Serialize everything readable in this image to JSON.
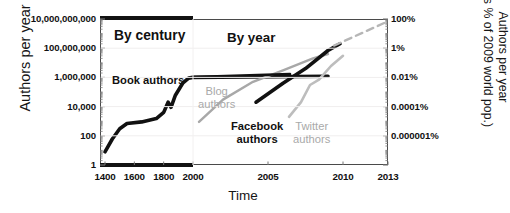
{
  "chart_data": {
    "type": "line",
    "title": "",
    "xlabel": "Time",
    "ylabel": "Authors per year",
    "ylabel_right": "Authors per year (as % of 2009 world pop.)",
    "ylabel_right_line1": "Authors per year",
    "ylabel_right_line2": "(as % of 2009 world pop.)",
    "yticks": [
      "10,000,000,000",
      "100,000,000",
      "1,000,000",
      "10,000",
      "100",
      "1"
    ],
    "yticks_values": [
      10000000000,
      100000000,
      1000000,
      10000,
      100,
      1
    ],
    "yticks_right": [
      "100%",
      "1%",
      "0.01%",
      "0.0001%",
      "0.000001%"
    ],
    "yticks_right_values": [
      100,
      1,
      0.01,
      0.0001,
      1e-06
    ],
    "ylim": [
      1,
      10000000000
    ],
    "yscale": "log",
    "xticks_century": [
      "1400",
      "1600",
      "1800",
      "2000"
    ],
    "xticks_year": [
      "2005",
      "2010",
      "2013"
    ],
    "grid": false,
    "sections": [
      {
        "label": "By century",
        "range": "1400-2000"
      },
      {
        "label": "By year",
        "range": "2000-2013"
      }
    ],
    "series": [
      {
        "name": "Book authors",
        "color": "#111111",
        "style": "solid",
        "points": [
          {
            "x": 1400,
            "y": 8
          },
          {
            "x": 1450,
            "y": 60
          },
          {
            "x": 1500,
            "y": 300
          },
          {
            "x": 1550,
            "y": 700
          },
          {
            "x": 1650,
            "y": 900
          },
          {
            "x": 1750,
            "y": 1500
          },
          {
            "x": 1800,
            "y": 4000
          },
          {
            "x": 1830,
            "y": 20000
          },
          {
            "x": 1850,
            "y": 9000
          },
          {
            "x": 1880,
            "y": 60000
          },
          {
            "x": 1930,
            "y": 400000
          },
          {
            "x": 1970,
            "y": 900000
          },
          {
            "x": 2000,
            "y": 1000000
          },
          {
            "x": 2009,
            "y": 1200000
          }
        ]
      },
      {
        "name": "Blog authors",
        "color": "#a8a8a8",
        "style": "solid",
        "points": [
          {
            "x": 2000.4,
            "y": 900
          },
          {
            "x": 2002,
            "y": 30000
          },
          {
            "x": 2004,
            "y": 500000
          },
          {
            "x": 2006,
            "y": 3000000
          },
          {
            "x": 2008,
            "y": 20000000
          },
          {
            "x": 2009,
            "y": 40000000
          }
        ]
      },
      {
        "name": "Facebook authors",
        "color": "#111111",
        "style": "solid",
        "points": [
          {
            "x": 2004.2,
            "y": 20000
          },
          {
            "x": 2006,
            "y": 400000
          },
          {
            "x": 2007.5,
            "y": 4000000
          },
          {
            "x": 2009,
            "y": 70000000
          },
          {
            "x": 2009.8,
            "y": 200000000
          }
        ]
      },
      {
        "name": "Twitter authors",
        "color": "#bdbdbd",
        "style": "solid",
        "points": [
          {
            "x": 2006.4,
            "y": 2000
          },
          {
            "x": 2007.2,
            "y": 20000
          },
          {
            "x": 2007.8,
            "y": 300000
          },
          {
            "x": 2008.4,
            "y": 700000
          },
          {
            "x": 2009.2,
            "y": 6000000
          },
          {
            "x": 2010,
            "y": 30000000
          }
        ]
      },
      {
        "name": "Projection",
        "color": "#b6b6b6",
        "style": "dashed",
        "points": [
          {
            "x": 2009.4,
            "y": 150000000
          },
          {
            "x": 2013,
            "y": 7000000000
          }
        ]
      }
    ],
    "annotations": [
      {
        "text": "By century",
        "kind": "section-label"
      },
      {
        "text": "By year",
        "kind": "section-label"
      },
      {
        "text": "Book authors",
        "kind": "series-label"
      },
      {
        "text": "Blog",
        "kind": "series-label"
      },
      {
        "text": "authors",
        "kind": "series-label"
      },
      {
        "text": "Facebook",
        "kind": "series-label"
      },
      {
        "text": "authors",
        "kind": "series-label"
      },
      {
        "text": "Twitter",
        "kind": "series-label"
      },
      {
        "text": "authors",
        "kind": "series-label"
      }
    ],
    "labels": {
      "book": "Book authors",
      "blog_l1": "Blog",
      "blog_l2": "authors",
      "facebook_l1": "Facebook",
      "facebook_l2": "authors",
      "twitter_l1": "Twitter",
      "twitter_l2": "authors"
    },
    "colors": {
      "axis": "#4a4a4a",
      "dark_series": "#111111",
      "mid_gray_series": "#a8a8a8",
      "light_gray_series": "#bdbdbd",
      "dashed_projection": "#b6b6b6",
      "section_bar": "#121212",
      "background": "#ffffff"
    }
  }
}
